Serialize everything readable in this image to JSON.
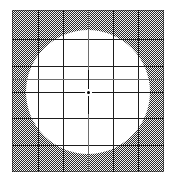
{
  "figure": {
    "title": "Shaded square test plate with circular clear aperture and measurement grid",
    "caption": "",
    "canvas": {
      "width": 172,
      "height": 182,
      "background": "#ffffff"
    }
  },
  "plate": {
    "label": "shaded-plate",
    "x": 12,
    "y": 10,
    "width": 152,
    "height": 162,
    "fill_pattern": "checkerboard-dither",
    "fill_color": "#2a2a2a",
    "background_color": "#f2f2f2",
    "edge_color": "#141414"
  },
  "aperture": {
    "label": "clear-circular-aperture",
    "center_x": 88,
    "center_y": 92,
    "radius": 62,
    "diameter": 124,
    "fill": "#ffffff"
  },
  "grid": {
    "line_color": "#1d1d1d",
    "minor_line_color": "#6e6e6e",
    "line_width": 1,
    "vertical_x": [
      38,
      63,
      88,
      113,
      138
    ],
    "horizontal_y": [
      39,
      66,
      92,
      118,
      145
    ],
    "minor_vertical_x": [
      88
    ],
    "minor_horizontal_y": [
      79
    ],
    "columns": 6,
    "rows": 6
  },
  "fiducial": {
    "label": "center-crosshair",
    "center_x": 88,
    "center_y": 92,
    "arm_length": 22,
    "dot_diameter": 3,
    "color": "#111111"
  },
  "colors": {
    "ink": "#1d1d1d",
    "paper": "#ffffff",
    "shade": "#2a2a2a"
  }
}
